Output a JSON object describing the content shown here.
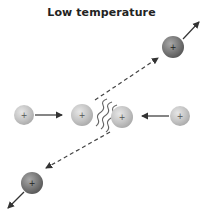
{
  "title": "Low temperature",
  "particles": [
    {
      "id": "top-right",
      "cx": 173,
      "cy": 47,
      "r": 11,
      "kind": "dark",
      "charge": "+"
    },
    {
      "id": "left",
      "cx": 24,
      "cy": 115,
      "r": 10,
      "kind": "light",
      "charge": "+"
    },
    {
      "id": "center-left",
      "cx": 82,
      "cy": 115,
      "r": 11,
      "kind": "light",
      "charge": "+"
    },
    {
      "id": "center-right",
      "cx": 122,
      "cy": 117,
      "r": 11,
      "kind": "light",
      "charge": "+"
    },
    {
      "id": "right",
      "cx": 180,
      "cy": 116,
      "r": 10,
      "kind": "light",
      "charge": "+"
    },
    {
      "id": "bottom-left",
      "cx": 32,
      "cy": 183,
      "r": 11,
      "kind": "dark",
      "charge": "+"
    }
  ],
  "colors": {
    "light_particle": "#c8c8c8",
    "dark_particle": "#777777",
    "arrow": "#333333",
    "title": "#222222"
  }
}
